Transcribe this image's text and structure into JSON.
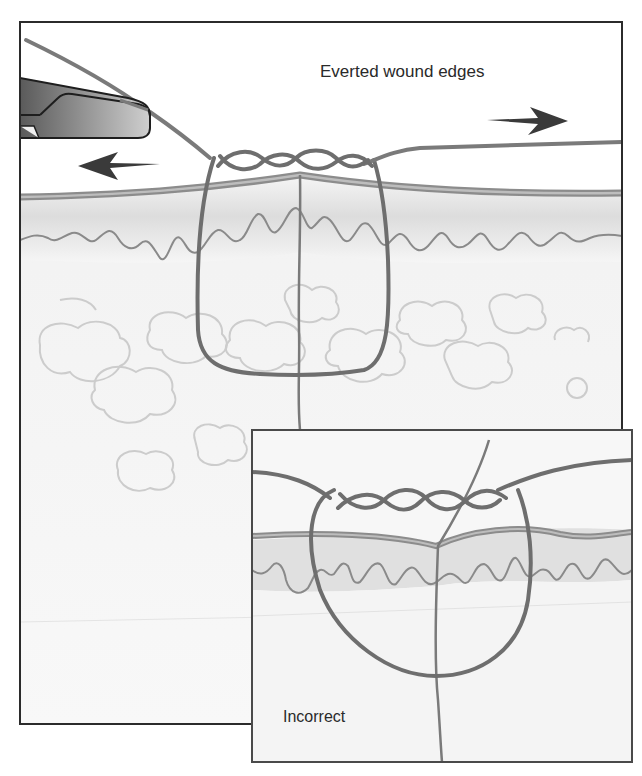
{
  "figure": {
    "main_panel": {
      "label": "Everted wound edges",
      "elements": [
        "needle-holder",
        "suture-thread",
        "surgeon-knot",
        "skin-epidermis",
        "dermal-papillae",
        "subcutaneous-fat",
        "wound-incision",
        "pull-arrow-left",
        "pull-arrow-right"
      ]
    },
    "inset_panel": {
      "label": "Incorrect",
      "elements": [
        "suture-loop",
        "surgeon-knot",
        "skin-epidermis",
        "dermal-papillae",
        "wound-incision"
      ]
    },
    "colors": {
      "suture": "#6e6e6e",
      "epidermis": "#8c8c8c",
      "frame": "#2b2b2b",
      "arrow": "#3a3a3a",
      "tissue_shade": "#d6d6d6",
      "fat": "#c9c9c9"
    }
  }
}
